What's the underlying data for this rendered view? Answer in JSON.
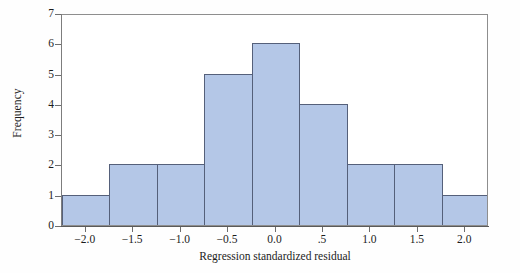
{
  "chart_data": {
    "type": "bar",
    "subtype": "histogram",
    "title": "",
    "xlabel": "Regression standardized residual",
    "ylabel": "Frequency",
    "xlim": [
      -2.25,
      2.25
    ],
    "ylim": [
      0,
      7
    ],
    "grid": false,
    "legend": null,
    "bin_width": 0.5,
    "bin_edges": [
      -2.25,
      -1.75,
      -1.25,
      -0.75,
      -0.25,
      0.25,
      0.75,
      1.25,
      1.75,
      2.25
    ],
    "bin_centers": [
      -2.0,
      -1.5,
      -1.0,
      -0.5,
      0.0,
      0.5,
      1.0,
      1.5,
      2.0
    ],
    "categories": [
      "-2.0",
      "-1.5",
      "-1.0",
      "-0.5",
      "0.0",
      ".5",
      "1.0",
      "1.5",
      "2.0"
    ],
    "values": [
      1,
      2,
      2,
      5,
      6,
      4,
      2,
      2,
      1
    ],
    "total_count": 25,
    "xticks": [
      -2.0,
      -1.5,
      -1.0,
      -0.5,
      0.0,
      0.5,
      1.0,
      1.5,
      2.0
    ],
    "xticklabels": [
      "−2.0",
      "−1.5",
      "−1.0",
      "−0.5",
      "0.0",
      ".5",
      "1.0",
      "1.5",
      "2.0"
    ],
    "yticks": [
      0,
      1,
      2,
      3,
      4,
      5,
      6,
      7
    ],
    "yticklabels": [
      "0",
      "1",
      "2",
      "3",
      "4",
      "5",
      "6",
      "7"
    ],
    "colors": {
      "bar_fill": "#b4c7e7",
      "bar_border": "#55607a",
      "frame": "#8e8e8e",
      "axis": "#5a5a5a",
      "background": "#ffffff",
      "text": "#1c1c1c"
    }
  }
}
